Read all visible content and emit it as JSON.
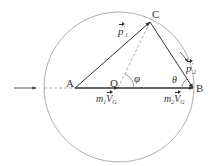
{
  "diagram": {
    "points": {
      "A": {
        "label": "A",
        "x": 75,
        "y": 88
      },
      "O": {
        "label": "O",
        "x": 118,
        "y": 88
      },
      "B": {
        "label": "B",
        "x": 193,
        "y": 88
      },
      "C": {
        "label": "C",
        "x": 150,
        "y": 22
      }
    },
    "circle": {
      "cx": 119,
      "cy": 87,
      "r": 75,
      "color": "#999999"
    },
    "labels": {
      "p1": {
        "main": "p",
        "sup": "′",
        "sub": "1"
      },
      "p2": {
        "main": "p",
        "sup": "′",
        "sub": "2"
      },
      "m1VG": {
        "m": "m",
        "msub": "1",
        "V": "V",
        "vsub": "G"
      },
      "m2VG": {
        "m": "m",
        "msub": "2",
        "V": "V",
        "vsub": "G"
      },
      "phi": "φ",
      "theta": "θ"
    },
    "colors": {
      "line": "#333333",
      "dashed": "#999999"
    }
  }
}
